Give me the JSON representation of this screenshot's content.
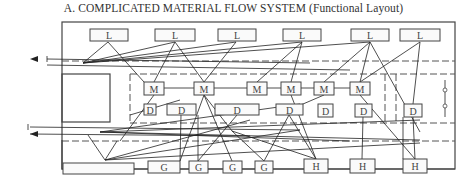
{
  "title": "A. COMPLICATED MATERIAL FLOW SYSTEM (Functional Layout)",
  "node_types": {
    "L": "L",
    "M": "M",
    "D": "D",
    "G": "G",
    "H": "H"
  },
  "nodes": {
    "L": [
      {
        "label": "L",
        "x": 90,
        "y": 29,
        "w": 38,
        "h": 12
      },
      {
        "label": "L",
        "x": 155,
        "y": 29,
        "w": 40,
        "h": 12
      },
      {
        "label": "L",
        "x": 218,
        "y": 29,
        "w": 38,
        "h": 12
      },
      {
        "label": "L",
        "x": 283,
        "y": 29,
        "w": 38,
        "h": 12
      },
      {
        "label": "L",
        "x": 351,
        "y": 29,
        "w": 38,
        "h": 12
      },
      {
        "label": "L",
        "x": 400,
        "y": 29,
        "w": 40,
        "h": 12
      }
    ],
    "M": [
      {
        "label": "M",
        "x": 144,
        "y": 82,
        "w": 20,
        "h": 13
      },
      {
        "label": "M",
        "x": 194,
        "y": 82,
        "w": 20,
        "h": 13
      },
      {
        "label": "M",
        "x": 247,
        "y": 82,
        "w": 20,
        "h": 13
      },
      {
        "label": "M",
        "x": 281,
        "y": 82,
        "w": 20,
        "h": 13
      },
      {
        "label": "M",
        "x": 314,
        "y": 82,
        "w": 20,
        "h": 13
      },
      {
        "label": "M",
        "x": 350,
        "y": 82,
        "w": 20,
        "h": 13
      }
    ],
    "D": [
      {
        "label": "D",
        "x": 144,
        "y": 104,
        "w": 12,
        "h": 11
      },
      {
        "label": "D",
        "x": 167,
        "y": 104,
        "w": 29,
        "h": 11
      },
      {
        "label": "D",
        "x": 215,
        "y": 104,
        "w": 44,
        "h": 11
      },
      {
        "label": "D",
        "x": 276,
        "y": 104,
        "w": 27,
        "h": 11
      },
      {
        "label": "D",
        "x": 318,
        "y": 104,
        "w": 15,
        "h": 13
      },
      {
        "label": "D",
        "x": 355,
        "y": 104,
        "w": 17,
        "h": 13
      },
      {
        "label": "D",
        "x": 404,
        "y": 104,
        "w": 18,
        "h": 13
      }
    ],
    "G": [
      {
        "label": "G",
        "x": 148,
        "y": 161,
        "w": 32,
        "h": 12
      },
      {
        "label": "G",
        "x": 189,
        "y": 161,
        "w": 19,
        "h": 12
      },
      {
        "label": "G",
        "x": 223,
        "y": 161,
        "w": 19,
        "h": 12
      },
      {
        "label": "G",
        "x": 255,
        "y": 161,
        "w": 18,
        "h": 12
      }
    ],
    "H": [
      {
        "label": "H",
        "x": 304,
        "y": 159,
        "w": 24,
        "h": 14
      },
      {
        "label": "H",
        "x": 350,
        "y": 159,
        "w": 25,
        "h": 14
      },
      {
        "label": "H",
        "x": 403,
        "y": 159,
        "w": 24,
        "h": 14
      }
    ]
  },
  "blank_box": {
    "x": 63,
    "y": 163,
    "w": 71,
    "h": 11
  },
  "arrows": [
    {
      "from": [
        47,
        59
      ],
      "to": [
        30,
        59
      ]
    },
    {
      "from": [
        47,
        65
      ],
      "to": [
        30,
        65
      ]
    }
  ]
}
